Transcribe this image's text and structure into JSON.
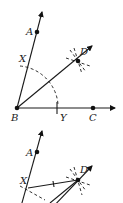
{
  "figure_top": {
    "labels": {
      "A": "A",
      "B": "B",
      "C": "C",
      "D": "D",
      "X": "X",
      "Y": "Y"
    },
    "description": "Bisecting angle ABC: arc from B meets rays at X and Y; arcs from X and Y intersect at D; ray BD bisects the angle"
  },
  "figure_bottom": {
    "labels": {
      "A": "A",
      "D": "D",
      "X": "X"
    },
    "description": "Segments XD with tick marks showing congruence"
  },
  "colors": {
    "ink": "#1a1a1a",
    "background": "#ffffff"
  }
}
